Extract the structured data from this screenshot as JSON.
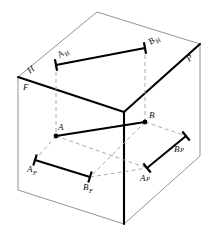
{
  "figure": {
    "type": "descriptive-geometry-diagram",
    "width": 215,
    "height": 238,
    "background_color": "#ffffff",
    "line_color": "#000000",
    "construction_color": "#999999",
    "label_color": "#111111"
  },
  "planes": {
    "horizontal": {
      "code": "H",
      "label": "H",
      "name": "horizontal-plane"
    },
    "frontal": {
      "code": "F",
      "label": "F",
      "name": "frontal-plane"
    },
    "profile": {
      "code": "P",
      "label": "P",
      "name": "profile-plane"
    }
  },
  "points": {
    "a_space": {
      "label": "A",
      "x": 56,
      "y": 136
    },
    "b_space": {
      "label": "B",
      "x": 145,
      "y": 122
    },
    "a_horizontal": {
      "label": "A",
      "sub": "H",
      "x": 56,
      "y": 65
    },
    "b_horizontal": {
      "label": "B",
      "sub": "H",
      "x": 145,
      "y": 48
    },
    "a_frontal": {
      "label": "A",
      "sub": "F",
      "x": 35,
      "y": 160
    },
    "b_frontal": {
      "label": "B",
      "sub": "F",
      "x": 90,
      "y": 177
    },
    "a_profile": {
      "label": "A",
      "sub": "P",
      "x": 147,
      "y": 168
    },
    "b_profile": {
      "label": "B",
      "sub": "P",
      "x": 186,
      "y": 136
    }
  },
  "segments": {
    "ab_space": {
      "name": "line-ab",
      "from": "A",
      "to": "B"
    },
    "ab_horizontal": {
      "name": "horizontal-projection",
      "from": "AH",
      "to": "BH"
    },
    "ab_frontal": {
      "name": "frontal-projection",
      "from": "AF",
      "to": "BF"
    },
    "ab_profile": {
      "name": "profile-projection",
      "from": "AP",
      "to": "BP"
    }
  },
  "box": {
    "name": "projection-box",
    "corner_front_top_left": {
      "x": 18,
      "y": 77
    },
    "corner_back_top": {
      "x": 97,
      "y": 12
    },
    "corner_back_right": {
      "x": 200,
      "y": 44
    },
    "corner_center_fold": {
      "x": 124,
      "y": 112
    },
    "corner_front_bottom_left": {
      "x": 18,
      "y": 190
    },
    "corner_front_bottom_center": {
      "x": 124,
      "y": 224
    },
    "corner_right_bottom": {
      "x": 200,
      "y": 156
    }
  },
  "labels": {
    "h_plane": "H",
    "f_plane": "F",
    "p_plane": "P",
    "a": "A",
    "b": "B",
    "a_h_base": "A",
    "a_h_sub": "H",
    "b_h_base": "B",
    "b_h_sub": "H",
    "a_f_base": "A",
    "a_f_sub": "F",
    "b_f_base": "B",
    "b_f_sub": "F",
    "a_p_base": "A",
    "a_p_sub": "P",
    "b_p_base": "B",
    "b_p_sub": "P"
  }
}
